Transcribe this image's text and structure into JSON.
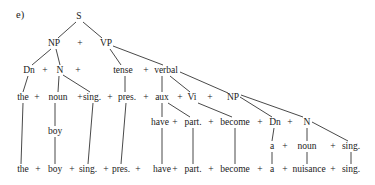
{
  "figure": {
    "label": "e)",
    "type": "phrase-structure tree",
    "nodes": [
      {
        "id": "S",
        "text": "S",
        "x": 79,
        "y": 19
      },
      {
        "id": "NP1",
        "text": "NP",
        "x": 54,
        "y": 46
      },
      {
        "id": "plus_np_vp",
        "text": "+",
        "x": 80,
        "y": 46
      },
      {
        "id": "VP",
        "text": "VP",
        "x": 106,
        "y": 46
      },
      {
        "id": "Dn1",
        "text": "Dn",
        "x": 29,
        "y": 73
      },
      {
        "id": "p_dn_n",
        "text": "+",
        "x": 45,
        "y": 73
      },
      {
        "id": "N1",
        "text": "N",
        "x": 60,
        "y": 73
      },
      {
        "id": "p_n_after",
        "text": "+",
        "x": 78,
        "y": 73
      },
      {
        "id": "tense",
        "text": "tense",
        "x": 123,
        "y": 73
      },
      {
        "id": "p_tense_verbal",
        "text": "+",
        "x": 146,
        "y": 73
      },
      {
        "id": "verbal",
        "text": "verbal",
        "x": 166,
        "y": 73
      },
      {
        "id": "the1",
        "text": "the",
        "x": 23,
        "y": 100
      },
      {
        "id": "p_r4_1",
        "text": "+",
        "x": 37,
        "y": 100
      },
      {
        "id": "noun1",
        "text": "noun",
        "x": 58,
        "y": 100
      },
      {
        "id": "p_r4_2",
        "text": "+",
        "x": 80,
        "y": 100
      },
      {
        "id": "sing1",
        "text": "sing.",
        "x": 92,
        "y": 100
      },
      {
        "id": "p_r4_3",
        "text": "+",
        "x": 110,
        "y": 100
      },
      {
        "id": "pres1",
        "text": "pres.",
        "x": 127,
        "y": 100
      },
      {
        "id": "p_r4_4",
        "text": "+",
        "x": 146,
        "y": 100
      },
      {
        "id": "aux",
        "text": "aux",
        "x": 162,
        "y": 100
      },
      {
        "id": "p_r4_5",
        "text": "+",
        "x": 180,
        "y": 100
      },
      {
        "id": "Vi",
        "text": "Vi",
        "x": 192,
        "y": 100
      },
      {
        "id": "p_r4_6",
        "text": "+",
        "x": 210,
        "y": 100
      },
      {
        "id": "NP2",
        "text": "NP",
        "x": 233,
        "y": 100
      },
      {
        "id": "have1",
        "text": "have",
        "x": 160,
        "y": 125
      },
      {
        "id": "p_r5_1",
        "text": "+",
        "x": 175,
        "y": 125
      },
      {
        "id": "part1",
        "text": "part.",
        "x": 193,
        "y": 125
      },
      {
        "id": "p_r5_2",
        "text": "+",
        "x": 211,
        "y": 125
      },
      {
        "id": "become1",
        "text": "become",
        "x": 235,
        "y": 125
      },
      {
        "id": "p_r5_3",
        "text": "+",
        "x": 260,
        "y": 125
      },
      {
        "id": "Dn2",
        "text": "Dn",
        "x": 275,
        "y": 125
      },
      {
        "id": "p_r5_4",
        "text": "+",
        "x": 290,
        "y": 125
      },
      {
        "id": "N2",
        "text": "N",
        "x": 307,
        "y": 125
      },
      {
        "id": "boy1",
        "text": "boy",
        "x": 55,
        "y": 134
      },
      {
        "id": "a1",
        "text": "a",
        "x": 272,
        "y": 149
      },
      {
        "id": "p_r6_1",
        "text": "+",
        "x": 285,
        "y": 149
      },
      {
        "id": "noun2",
        "text": "noun",
        "x": 307,
        "y": 149
      },
      {
        "id": "p_r6_2",
        "text": "+",
        "x": 333,
        "y": 149
      },
      {
        "id": "sing2",
        "text": "sing.",
        "x": 351,
        "y": 149
      },
      {
        "id": "the2",
        "text": "the",
        "x": 23,
        "y": 172
      },
      {
        "id": "p_r7_1",
        "text": "+",
        "x": 38,
        "y": 172
      },
      {
        "id": "boy2",
        "text": "boy",
        "x": 55,
        "y": 172
      },
      {
        "id": "p_r7_2",
        "text": "+",
        "x": 72,
        "y": 172
      },
      {
        "id": "sing3",
        "text": "sing.",
        "x": 88,
        "y": 172
      },
      {
        "id": "p_r7_3",
        "text": "+",
        "x": 106,
        "y": 172
      },
      {
        "id": "pres2",
        "text": "pres.",
        "x": 121,
        "y": 172
      },
      {
        "id": "p_r7_4",
        "text": "+",
        "x": 138,
        "y": 172
      },
      {
        "id": "have2",
        "text": "have",
        "x": 162,
        "y": 172
      },
      {
        "id": "p_r7_5",
        "text": "+",
        "x": 175,
        "y": 172
      },
      {
        "id": "part2",
        "text": "part.",
        "x": 193,
        "y": 172
      },
      {
        "id": "p_r7_6",
        "text": "+",
        "x": 211,
        "y": 172
      },
      {
        "id": "become2",
        "text": "become",
        "x": 235,
        "y": 172
      },
      {
        "id": "p_r7_7",
        "text": "+",
        "x": 260,
        "y": 172
      },
      {
        "id": "a2",
        "text": "a",
        "x": 272,
        "y": 172
      },
      {
        "id": "p_r7_8",
        "text": "+",
        "x": 285,
        "y": 172
      },
      {
        "id": "nuisance",
        "text": "nuisance",
        "x": 309,
        "y": 172
      },
      {
        "id": "p_r7_9",
        "text": "+",
        "x": 333,
        "y": 172
      },
      {
        "id": "sing4",
        "text": "sing.",
        "x": 351,
        "y": 172
      }
    ],
    "edges": [
      {
        "x1": 76,
        "y1": 22,
        "x2": 58,
        "y2": 38
      },
      {
        "x1": 83,
        "y1": 22,
        "x2": 102,
        "y2": 38
      },
      {
        "x1": 51,
        "y1": 49,
        "x2": 32,
        "y2": 65
      },
      {
        "x1": 56,
        "y1": 49,
        "x2": 60,
        "y2": 65
      },
      {
        "x1": 110,
        "y1": 49,
        "x2": 121,
        "y2": 65
      },
      {
        "x1": 113,
        "y1": 46,
        "x2": 163,
        "y2": 65
      },
      {
        "x1": 28,
        "y1": 76,
        "x2": 23,
        "y2": 92
      },
      {
        "x1": 59,
        "y1": 76,
        "x2": 58,
        "y2": 92
      },
      {
        "x1": 63,
        "y1": 75,
        "x2": 90,
        "y2": 92
      },
      {
        "x1": 125,
        "y1": 76,
        "x2": 125,
        "y2": 92
      },
      {
        "x1": 162,
        "y1": 76,
        "x2": 162,
        "y2": 92
      },
      {
        "x1": 170,
        "y1": 76,
        "x2": 190,
        "y2": 92
      },
      {
        "x1": 180,
        "y1": 72,
        "x2": 228,
        "y2": 93
      },
      {
        "x1": 23,
        "y1": 103,
        "x2": 21,
        "y2": 164
      },
      {
        "x1": 55,
        "y1": 103,
        "x2": 55,
        "y2": 126
      },
      {
        "x1": 55,
        "y1": 137,
        "x2": 55,
        "y2": 164
      },
      {
        "x1": 93,
        "y1": 103,
        "x2": 88,
        "y2": 164
      },
      {
        "x1": 126,
        "y1": 103,
        "x2": 121,
        "y2": 164
      },
      {
        "x1": 162,
        "y1": 103,
        "x2": 162,
        "y2": 117
      },
      {
        "x1": 168,
        "y1": 103,
        "x2": 190,
        "y2": 117
      },
      {
        "x1": 198,
        "y1": 103,
        "x2": 232,
        "y2": 117
      },
      {
        "x1": 240,
        "y1": 97,
        "x2": 272,
        "y2": 117
      },
      {
        "x1": 241,
        "y1": 95,
        "x2": 303,
        "y2": 117
      },
      {
        "x1": 162,
        "y1": 128,
        "x2": 162,
        "y2": 164
      },
      {
        "x1": 193,
        "y1": 128,
        "x2": 193,
        "y2": 164
      },
      {
        "x1": 235,
        "y1": 128,
        "x2": 235,
        "y2": 164
      },
      {
        "x1": 274,
        "y1": 128,
        "x2": 272,
        "y2": 141
      },
      {
        "x1": 307,
        "y1": 128,
        "x2": 307,
        "y2": 141
      },
      {
        "x1": 312,
        "y1": 122,
        "x2": 348,
        "y2": 141
      },
      {
        "x1": 272,
        "y1": 152,
        "x2": 272,
        "y2": 164
      },
      {
        "x1": 307,
        "y1": 152,
        "x2": 307,
        "y2": 164
      },
      {
        "x1": 351,
        "y1": 152,
        "x2": 351,
        "y2": 164
      }
    ]
  }
}
